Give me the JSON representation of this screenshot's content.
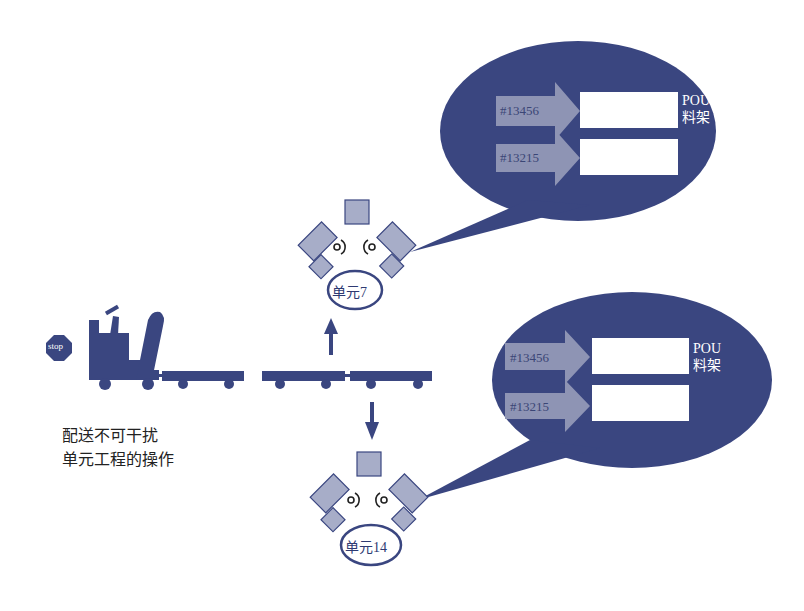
{
  "colors": {
    "navy": "#3a4680",
    "slate": "#a7adc8",
    "slate_border": "#3a4680",
    "arrow_fill": "#8e94b4",
    "white": "#ffffff",
    "caption": "#222222"
  },
  "stop_sign": {
    "label": "stop"
  },
  "caption": {
    "line1": "配送不可干扰",
    "line2": "单元工程的操作"
  },
  "cells": [
    {
      "label": "单元7"
    },
    {
      "label": "单元14"
    }
  ],
  "bubbles": [
    {
      "parts": [
        {
          "id": "#13456"
        },
        {
          "id": "#13215"
        }
      ],
      "rack_label_line1": "POU",
      "rack_label_line2": "料架"
    },
    {
      "parts": [
        {
          "id": "#13456"
        },
        {
          "id": "#13215"
        }
      ],
      "rack_label_line1": "POU",
      "rack_label_line2": "料架"
    }
  ],
  "icons": {
    "tugger": "tugger-truck-icon",
    "cart": "cart-icon",
    "arrow_up": "arrow-up-icon",
    "arrow_down": "arrow-down-icon",
    "operator": "operator-icon"
  }
}
